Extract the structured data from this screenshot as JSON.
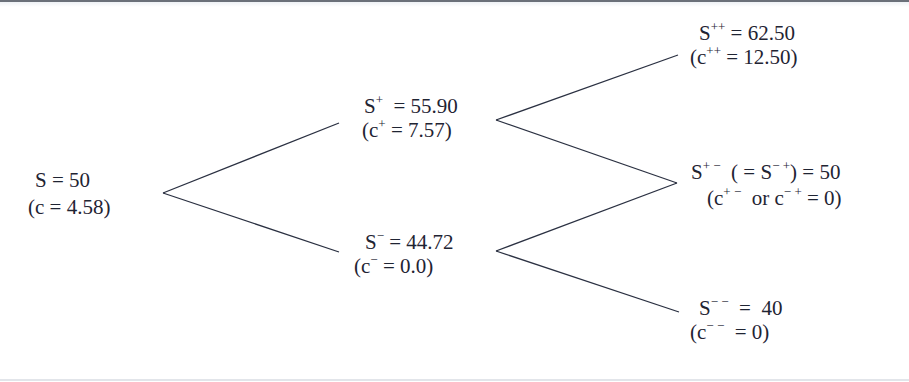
{
  "diagram": {
    "type": "binomial-tree",
    "colors": {
      "line": "#2b3142",
      "text": "#1f2433",
      "background": "#ffffff",
      "top_rule": "#6b7079"
    },
    "nodes": {
      "root": {
        "price_label": "S = 50",
        "option_label": "(c = 4.58)"
      },
      "up": {
        "price_base": "S",
        "price_sup": "+",
        "price_rest": "  = 55.90",
        "option_open": "(c",
        "option_sup": "+",
        "option_rest": " = 7.57)"
      },
      "down": {
        "price_base": "S",
        "price_sup": "−",
        "price_rest": " = 44.72",
        "option_open": "(c",
        "option_sup": "−",
        "option_rest": " = 0.0)"
      },
      "up_up": {
        "price_base": "S",
        "price_sup": "++",
        "price_rest": " = 62.50",
        "option_open": "(c",
        "option_sup": "++",
        "option_rest": " = 12.50)"
      },
      "up_down": {
        "price_base": "S",
        "price_sup": "+ −",
        "price_mid": "  ( = S",
        "price_mid_sup": "− +",
        "price_rest": ") = 50",
        "option_open": "(c",
        "option_sup": "+ −",
        "option_mid": "  or c",
        "option_mid_sup": "− +",
        "option_rest": " = 0)"
      },
      "down_down": {
        "price_base": "S",
        "price_sup": "− −",
        "price_rest": "  =  40",
        "option_open": "(c",
        "option_sup": "− −",
        "option_rest": "  = 0)"
      }
    },
    "edges": [
      {
        "from": "root",
        "to": "up",
        "x1": 163,
        "y1": 193,
        "x2": 339,
        "y2": 123
      },
      {
        "from": "root",
        "to": "down",
        "x1": 163,
        "y1": 193,
        "x2": 339,
        "y2": 252
      },
      {
        "from": "up",
        "to": "up_up",
        "x1": 496,
        "y1": 120,
        "x2": 678,
        "y2": 55
      },
      {
        "from": "up",
        "to": "up_down",
        "x1": 496,
        "y1": 120,
        "x2": 677,
        "y2": 183
      },
      {
        "from": "down",
        "to": "up_down",
        "x1": 496,
        "y1": 251,
        "x2": 677,
        "y2": 183
      },
      {
        "from": "down",
        "to": "down_down",
        "x1": 496,
        "y1": 251,
        "x2": 679,
        "y2": 312
      }
    ]
  }
}
